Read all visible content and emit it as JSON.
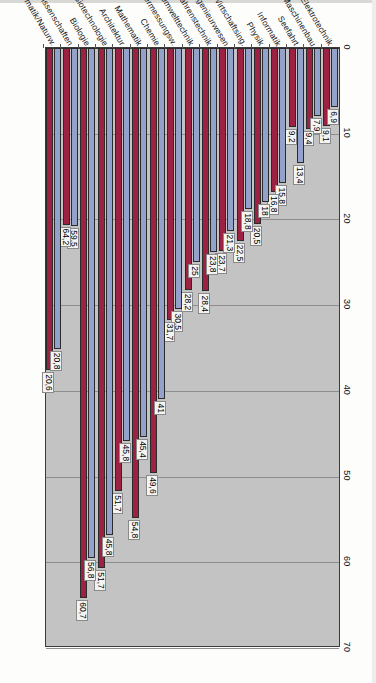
{
  "chart_data": {
    "type": "bar",
    "orientation": "horizontal",
    "title": "",
    "subtitle": "",
    "xlabel": "",
    "ylabel": "",
    "xlim": [
      0,
      70
    ],
    "grid": true,
    "legend_position": "none",
    "axis_ticks": [
      "0",
      "10",
      "20",
      "30",
      "40",
      "50",
      "60",
      "70"
    ],
    "categories": [
      "Elektrotechnik",
      "Maschinenbau",
      "Seefahrt",
      "Informatik",
      "Physik",
      "Wirtschaftsing.",
      "Bauingenieurwesen",
      "Verfahrenstechnik",
      "Umwelttechnik",
      "Vermessungsw.",
      "Chemie",
      "Mathematik",
      "Architektur",
      "Biotechnologie",
      "Biologie",
      "Ingenieurwissenschaften",
      "Mathematik/Naturw."
    ],
    "series": [
      {
        "name": "series-1",
        "color": "#93a1cb",
        "values": [
          6.9,
          7.9,
          13.4,
          15.8,
          18.0,
          18.8,
          21.3,
          23.8,
          25.0,
          30.5,
          41.0,
          45.4,
          45.8,
          56.8,
          59.5,
          20.8,
          35.1
        ]
      },
      {
        "name": "series-2",
        "color": "#9d2142",
        "values": [
          9.1,
          9.4,
          9.2,
          16.8,
          20.5,
          22.5,
          23.7,
          28.4,
          28.2,
          31.7,
          49.6,
          54.8,
          51.7,
          60.7,
          64.2,
          20.6,
          37.6
        ]
      }
    ],
    "data_labels": [
      {
        "category": "Elektrotechnik",
        "s1": "6,9",
        "s2": "9,1"
      },
      {
        "category": "Maschinenbau",
        "s1": "7,9",
        "s2": "9,4"
      },
      {
        "category": "Seefahrt",
        "s1": "13,4",
        "s2": "9,2"
      },
      {
        "category": "Informatik",
        "s1": "15,8",
        "s2": "16,8"
      },
      {
        "category": "Physik",
        "s1": "18",
        "s2": "20,5"
      },
      {
        "category": "Wirtschaftsing.",
        "s1": "18,8",
        "s2": "22,5"
      },
      {
        "category": "Bauingenieurwesen",
        "s1": "21,3",
        "s2": "23,7"
      },
      {
        "category": "Verfahrenstechnik",
        "s1": "23,8",
        "s2": "28,4"
      },
      {
        "category": "Umwelttechnik",
        "s1": "25",
        "s2": "28,2"
      },
      {
        "category": "Vermessungsw.",
        "s1": "30,5",
        "s2": "31,7"
      },
      {
        "category": "Chemie",
        "s1": "41",
        "s2": "49,6"
      },
      {
        "category": "Mathematik",
        "s1": "45,4",
        "s2": "54,8"
      },
      {
        "category": "Architektur",
        "s1": "45,8",
        "s2": "51,7"
      },
      {
        "category": "Biotechnologie",
        "s1": "45,8",
        "s2": "51,7"
      },
      {
        "category": "Biologie",
        "s1": "56,8",
        "s2": "60,7"
      },
      {
        "category": "Ingenieurwissenschaften",
        "s1": "59,5",
        "s2": "64,2"
      },
      {
        "category": "Mathematik/Naturw.",
        "s1": "20,8",
        "s2": "20,6"
      }
    ],
    "colors": {
      "series_1": "#93a1cb",
      "series_2": "#9d2142",
      "plot_background": "#c3c3c3",
      "gridline": "#8e8e8e",
      "axis": "#3a3a3a",
      "page_background": "#fdfdfc"
    }
  }
}
